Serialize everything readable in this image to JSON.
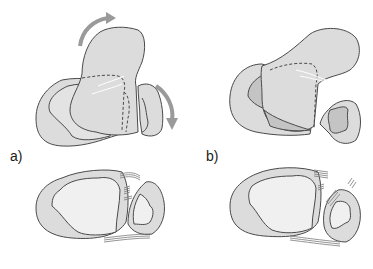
{
  "figure": {
    "panels": [
      {
        "id": "a",
        "label": "a)"
      },
      {
        "id": "b",
        "label": "b)"
      }
    ]
  },
  "colors": {
    "bone_fill": "#dcdcdc",
    "bone_fill_light": "#e6e6e6",
    "bone_fill_dark": "#c4c4c4",
    "outline": "#4a4a4a",
    "arrow": "#9a9a9a",
    "ligament": "#7a7a7a",
    "background": "#ffffff"
  }
}
